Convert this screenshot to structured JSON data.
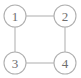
{
  "figure": {
    "kind": "undirected-graph-diagram",
    "background_color": "#ffffff",
    "stroke_color": "#b4b4b4",
    "node_fill_color": "#ffffff",
    "node_stroke_color": "#b0b0b0",
    "label_color": "#6e6e6e",
    "node_radius": 11
  },
  "nodes": [
    {
      "id": "1",
      "label": "1",
      "cx": 15,
      "cy": 16
    },
    {
      "id": "2",
      "label": "2",
      "cx": 65,
      "cy": 16
    },
    {
      "id": "3",
      "label": "3",
      "cx": 15,
      "cy": 63
    },
    {
      "id": "4",
      "label": "4",
      "cx": 65,
      "cy": 63
    }
  ],
  "edges": [
    {
      "id": "edge-1-2",
      "from": "1",
      "to": "2",
      "x1": 26,
      "y1": 16,
      "x2": 54,
      "y2": 16
    },
    {
      "id": "edge-1-3",
      "from": "1",
      "to": "3",
      "x1": 15,
      "y1": 27,
      "x2": 15,
      "y2": 52
    },
    {
      "id": "edge-2-4",
      "from": "2",
      "to": "4",
      "x1": 65,
      "y1": 27,
      "x2": 65,
      "y2": 52
    },
    {
      "id": "edge-3-4",
      "from": "3",
      "to": "4",
      "x1": 26,
      "y1": 63,
      "x2": 54,
      "y2": 63
    }
  ]
}
